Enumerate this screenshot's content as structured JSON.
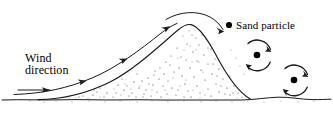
{
  "figure": {
    "background_color": "#ffffff",
    "ink_color": "#1a1a1a",
    "width": 333,
    "height": 122
  },
  "labels": {
    "wind_line1": "Wind",
    "wind_line2": "direction",
    "sand_particle": "Sand particle"
  },
  "diagram_data": {
    "type": "schematic",
    "subject": "Aeolian sand dune cross-section with wind streamlines and lee-side vortices",
    "elements": [
      "ground-line",
      "dune-outline",
      "sand-stipple-fill",
      "wind-direction-arrow",
      "windward-streamline",
      "crest-streamline-arc",
      "lee-vortex-upper",
      "lee-vortex-lower",
      "sand-particle-marker"
    ],
    "dune": {
      "crest_x": 190,
      "crest_y": 24,
      "windward_foot_x": 40,
      "lee_foot_x": 250,
      "base_y": 99,
      "windward_slope": "gentle",
      "lee_slope": "steep"
    },
    "ground": {
      "y": 99,
      "style": "wavy"
    },
    "wind": {
      "direction": "left-to-right",
      "arrow_count": 4
    },
    "vortices": [
      {
        "id": "upper",
        "center_x": 257,
        "center_y": 55,
        "radius": 14,
        "rotation": "clockwise"
      },
      {
        "id": "lower",
        "center_x": 294,
        "center_y": 80,
        "radius": 14,
        "rotation": "clockwise"
      }
    ],
    "particles": [
      {
        "id": "legend-marker",
        "x": 229,
        "y": 25,
        "r": 3.1
      },
      {
        "id": "upper-vortex-core",
        "x": 257,
        "y": 55,
        "r": 3.3
      },
      {
        "id": "lower-vortex-core",
        "x": 294,
        "y": 80,
        "r": 3.3
      }
    ]
  }
}
